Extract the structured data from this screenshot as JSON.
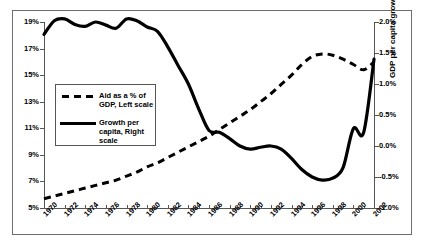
{
  "caption_partial": "",
  "axes": {
    "left_title": "Aid as a percentage of GDP",
    "right_title": "GDP per capita growth",
    "left_ticks": [
      "19%",
      "17%",
      "15%",
      "13%",
      "11%",
      "9%",
      "7%",
      "5%"
    ],
    "right_ticks": [
      "2.0%",
      "1.5%",
      "1.0%",
      "0.5%",
      "0.0%",
      "-0.5%",
      "-1.0%"
    ],
    "x_ticks": [
      "1970",
      "1972",
      "1974",
      "1976",
      "1978",
      "1980",
      "1982",
      "1984",
      "1986",
      "1988",
      "1990",
      "1992",
      "1994",
      "1996",
      "1998",
      "2000",
      "2002"
    ]
  },
  "legend": {
    "entry1_label": "Aid as a % of\nGDP, Left scale",
    "entry1_style": "dashed",
    "entry2_label": "Growth per\ncapita, Right\nscale",
    "entry2_style": "solid"
  },
  "colors": {
    "series": "#000000",
    "frame": "#6e6e6e",
    "axis": "#555555",
    "background": "#ffffff"
  },
  "chart_data": {
    "type": "line",
    "title": "",
    "xlabel": "",
    "ylabel": "Aid as a percentage of GDP",
    "y2label": "GDP per capita growth",
    "xlim": [
      1970,
      2002
    ],
    "ylim": [
      5,
      19
    ],
    "y2lim": [
      -1.0,
      2.0
    ],
    "grid": false,
    "legend_position": "inside-left",
    "x": [
      1970,
      1971,
      1972,
      1973,
      1974,
      1975,
      1976,
      1977,
      1978,
      1979,
      1980,
      1981,
      1982,
      1983,
      1984,
      1985,
      1986,
      1987,
      1988,
      1989,
      1990,
      1991,
      1992,
      1993,
      1994,
      1995,
      1996,
      1997,
      1998,
      1999,
      2000,
      2001,
      2002
    ],
    "series": [
      {
        "name": "Aid as a % of GDP, Left scale",
        "axis": "left",
        "style": "dashed",
        "units": "% of GDP",
        "values": [
          5.7,
          5.9,
          6.1,
          6.3,
          6.5,
          6.7,
          6.9,
          7.1,
          7.4,
          7.7,
          8.1,
          8.4,
          8.8,
          9.2,
          9.6,
          10.0,
          10.4,
          10.9,
          11.4,
          11.9,
          12.4,
          13.0,
          13.6,
          14.3,
          15.0,
          15.8,
          16.4,
          16.6,
          16.5,
          16.2,
          15.8,
          15.4,
          16.0
        ]
      },
      {
        "name": "Growth per capita, Right scale",
        "axis": "right",
        "style": "solid",
        "units": "% growth",
        "values": [
          1.8,
          2.02,
          2.05,
          1.96,
          1.93,
          2.0,
          1.95,
          1.9,
          2.05,
          2.02,
          1.92,
          1.88,
          1.86,
          1.8,
          1.6,
          1.3,
          1.05,
          0.82,
          0.55,
          0.28,
          0.24,
          0.26,
          0.2,
          0.05,
          -0.06,
          -0.07,
          -0.03,
          -0.01,
          -0.05,
          -0.18,
          -0.32,
          -0.45,
          -0.52
        ]
      }
    ],
    "series_notes": {
      "growth_extended": {
        "comment": "solid line continues after 2002 index alignment: trough near 1994 at -0.55%, recovery to 1.40% by 2002"
      }
    }
  },
  "chart_data_growth_full": {
    "x": [
      1970,
      1971,
      1972,
      1973,
      1974,
      1975,
      1976,
      1977,
      1978,
      1979,
      1980,
      1981,
      1982,
      1983,
      1984,
      1985,
      1986,
      1987,
      1988,
      1989,
      1990,
      1991,
      1992,
      1993,
      1994,
      1995,
      1996,
      1997,
      1998,
      1999,
      2000,
      2001,
      2002
    ],
    "values": [
      1.8,
      2.02,
      2.05,
      1.96,
      1.93,
      2.0,
      1.95,
      1.9,
      2.05,
      2.02,
      1.92,
      1.85,
      1.6,
      1.3,
      1.0,
      0.6,
      0.25,
      0.22,
      0.12,
      0.0,
      -0.05,
      -0.02,
      0.0,
      -0.05,
      -0.2,
      -0.38,
      -0.5,
      -0.55,
      -0.52,
      -0.35,
      0.28,
      0.22,
      1.4
    ]
  }
}
